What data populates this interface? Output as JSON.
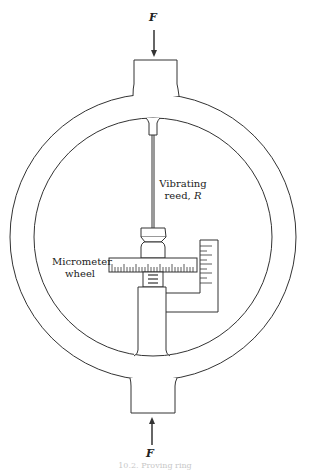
{
  "diagram": {
    "type": "proving-ring-schematic",
    "labels": {
      "force_top": "F",
      "force_bottom": "F",
      "reed_line1": "Vibrating",
      "reed_line2": "reed, ",
      "reed_symbol": "R",
      "micrometer_line1": "Micrometer",
      "micrometer_line2": "wheel"
    },
    "caption": "10.2. Proving ring"
  },
  "colors": {
    "stroke": "#333333",
    "background": "#ffffff"
  }
}
